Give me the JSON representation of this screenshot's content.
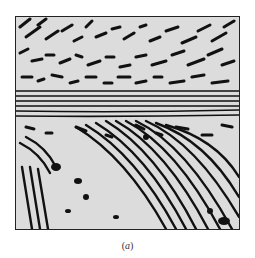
{
  "figure": {
    "caption": "(a)",
    "caption_parts": {
      "open": "(",
      "label": "a",
      "close": ")"
    },
    "colors": {
      "dark_phase": "#111111",
      "light_phase": "#d9d9d9",
      "border": "#222222"
    }
  }
}
